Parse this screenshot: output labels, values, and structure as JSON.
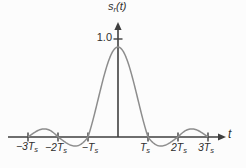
{
  "figure": {
    "title": {
      "main": "s",
      "sub": "r",
      "rest": "(t)"
    },
    "amplitude_label": "1.0",
    "x_axis_label": "t"
  },
  "chart_data": {
    "type": "line",
    "xlabel": "t",
    "ylabel": "s_r(t)",
    "x_unit": "T_s",
    "function": "s_r(t) = sinc(t/T_s) = sin(pi*t/T_s)/(pi*t/T_s)",
    "x_range_Ts": [
      -3,
      3
    ],
    "ylim": [
      -0.15,
      1.1
    ],
    "peak": {
      "x": 0,
      "y": 1.0
    },
    "zeros_Ts": [
      -3,
      -2,
      -1,
      1,
      2,
      3
    ],
    "side_lobe_extrema_as_drawn": [
      {
        "x": -2.5,
        "y": 0.09
      },
      {
        "x": -1.43,
        "y": -0.1
      },
      {
        "x": 1.43,
        "y": -0.1
      },
      {
        "x": 2.5,
        "y": 0.09
      }
    ],
    "grid": false,
    "legend": "none",
    "x_ticks": [
      {
        "u": -3,
        "label_main": "−3T",
        "label_sub": "s"
      },
      {
        "u": -2,
        "label_main": "−2T",
        "label_sub": "s"
      },
      {
        "u": -1,
        "label_main": "−T",
        "label_sub": "s"
      },
      {
        "u": 1,
        "label_main": "T",
        "label_sub": "s"
      },
      {
        "u": 2,
        "label_main": "2T",
        "label_sub": "s"
      },
      {
        "u": 3,
        "label_main": "3T",
        "label_sub": "s"
      }
    ],
    "y_ticks": [
      {
        "v": 1.0,
        "label": "1.0"
      }
    ],
    "colors": {
      "axis": "#3f3f3f",
      "curve": "#8d8d8d",
      "text": "#2f2f2f"
    }
  }
}
